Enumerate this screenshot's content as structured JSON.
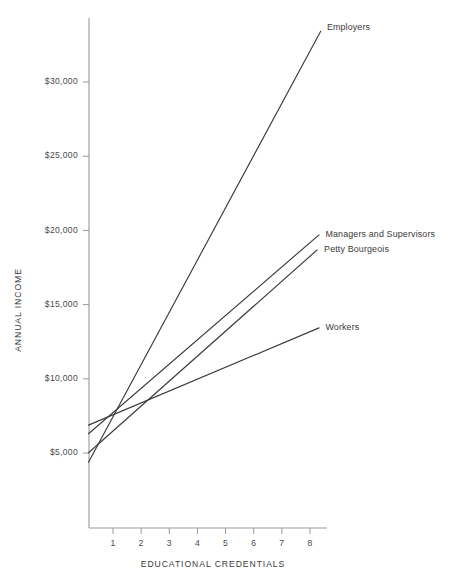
{
  "chart_data": {
    "type": "line",
    "title": "",
    "xlabel": "EDUCATIONAL CREDENTIALS",
    "ylabel": "ANNUAL INCOME",
    "xlim": [
      0,
      8.8
    ],
    "ylim": [
      0,
      34500
    ],
    "xticks": [
      1,
      2,
      3,
      4,
      5,
      6,
      7,
      8
    ],
    "xtick_labels": [
      "1",
      "2",
      "3",
      "4",
      "5",
      "6",
      "7",
      "8"
    ],
    "yticks": [
      5000,
      10000,
      15000,
      20000,
      25000,
      30000
    ],
    "ytick_labels": [
      "$5,000",
      "$10,000",
      "$15,000",
      "$20,000",
      "$25,000",
      "$30,000"
    ],
    "grid": false,
    "legend_position": "inline-right-end-of-line",
    "line_color": "#3c3c3c",
    "axis_color": "#9a9a9a",
    "series": [
      {
        "name": "Employers",
        "label": "Employers",
        "x": [
          0.13,
          8.38
        ],
        "values": [
          4380,
          33420
        ],
        "label_x": 8.6,
        "label_y": 33650
      },
      {
        "name": "Managers and Supervisors",
        "label": "Managers and Supervisors",
        "x": [
          0.13,
          8.32
        ],
        "values": [
          6300,
          19700
        ],
        "label_x": 8.55,
        "label_y": 19730
      },
      {
        "name": "Petty Bourgeois",
        "label": "Petty Bourgeois",
        "x": [
          0.13,
          8.25
        ],
        "values": [
          5020,
          18680
        ],
        "label_x": 8.5,
        "label_y": 18720
      },
      {
        "name": "Workers",
        "label": "Workers",
        "x": [
          0.13,
          8.32
        ],
        "values": [
          6880,
          13430
        ],
        "label_x": 8.55,
        "label_y": 13460
      }
    ]
  },
  "figure": {
    "x_axis_title": "EDUCATIONAL CREDENTIALS",
    "y_axis_title": "ANNUAL INCOME"
  }
}
